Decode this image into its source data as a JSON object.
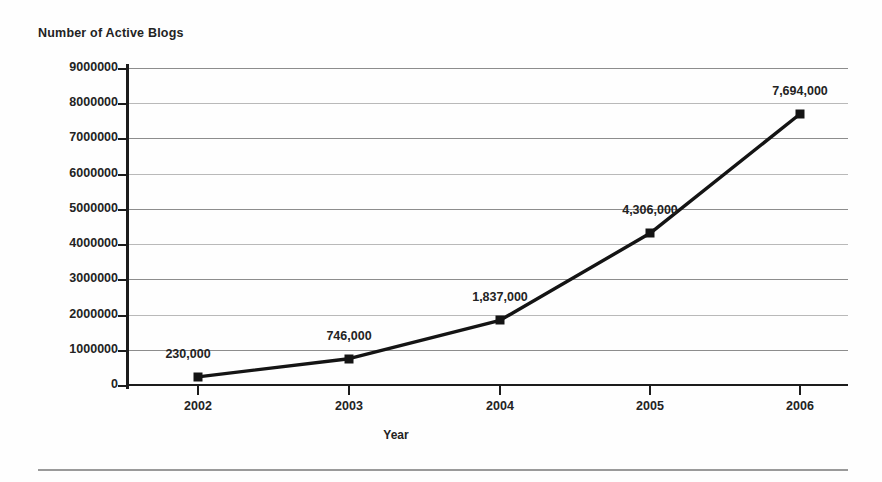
{
  "chart_data": {
    "type": "line",
    "title": "Number of Active Blogs",
    "xlabel": "Year",
    "ylabel": "Number of Active Blogs",
    "categories": [
      "2002",
      "2003",
      "2004",
      "2005",
      "2006"
    ],
    "values": [
      230000,
      746000,
      1837000,
      4306000,
      7694000
    ],
    "point_labels": [
      "230,000",
      "746,000",
      "1,837,000",
      "4,306,000",
      "7,694,000"
    ],
    "ylim": [
      0,
      9000000
    ],
    "ytick_labels": [
      "9000000",
      "8000000",
      "7000000",
      "6000000",
      "5000000",
      "4000000",
      "3000000",
      "2000000",
      "1000000",
      "0"
    ],
    "ytick_values": [
      9000000,
      8000000,
      7000000,
      6000000,
      5000000,
      4000000,
      3000000,
      2000000,
      1000000,
      0
    ],
    "grid": true,
    "legend": false,
    "series_color": "#141414",
    "marker": "square",
    "axis_color": "#1c1c1c",
    "grid_color": "#8d8d8d",
    "text_color": "#232323",
    "background": "#fefefe"
  }
}
